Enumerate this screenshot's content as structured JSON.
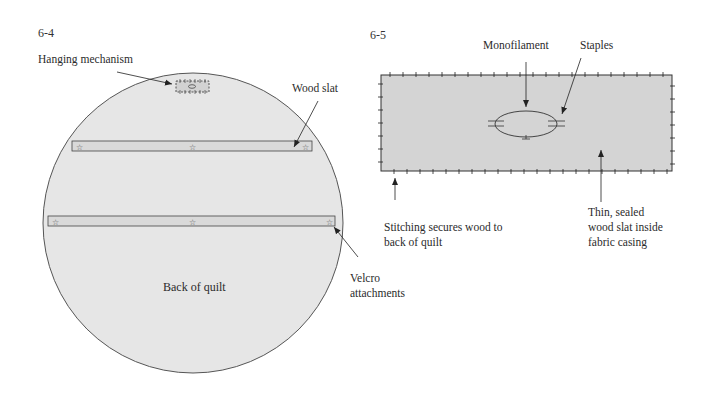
{
  "figures": [
    {
      "id": "6-4",
      "number_label": "6-4",
      "labels": {
        "hanging_mechanism": "Hanging mechanism",
        "wood_slat": "Wood slat",
        "back_of_quilt": "Back of quilt",
        "velcro": [
          "Velcro",
          "attachments"
        ]
      }
    },
    {
      "id": "6-5",
      "number_label": "6-5",
      "labels": {
        "monofilament": "Monofilament",
        "staples": "Staples",
        "stitching": [
          "Stitching secures wood to",
          "back of quilt"
        ],
        "slat_casing": [
          "Thin, sealed",
          "wood slat inside",
          "fabric casing"
        ]
      }
    }
  ],
  "colors": {
    "fabric_fill": "#e6e6e6",
    "casing_fill": "#d4d4d4",
    "slat_fill": "#d9d9d9",
    "outline": "#444444",
    "text": "#2b2b2b"
  },
  "icons": {
    "velcro_marker": "☆"
  }
}
